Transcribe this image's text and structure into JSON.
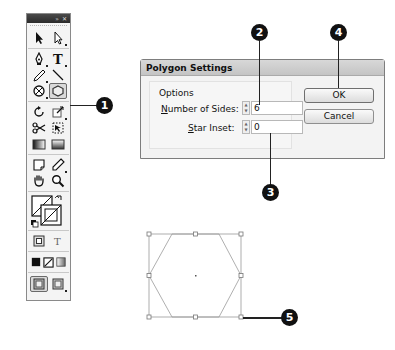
{
  "toolbox": {
    "title_buttons": [
      "»",
      "✕"
    ],
    "tools": [
      [
        "selection-tool",
        "direct-selection-tool"
      ],
      [
        "pen-tool",
        "type-tool"
      ],
      [
        "pencil-tool",
        "line-tool"
      ],
      [
        "ellipse-frame-tool",
        "polygon-tool"
      ],
      [
        "rotate-tool",
        "scale-tool"
      ],
      [
        "scissors-tool",
        "free-transform-tool"
      ],
      [
        "gradient-tool",
        "gradient-feather-tool"
      ],
      [
        "note-tool",
        "eyedropper-tool"
      ],
      [
        "hand-tool",
        "zoom-tool"
      ]
    ],
    "active_tool": "polygon-tool",
    "formatting_buttons": [
      "formatting-affects-container",
      "formatting-affects-text"
    ],
    "formatting_text_glyph": "T",
    "color_buttons": [
      "apply-color",
      "apply-none",
      "apply-gradient"
    ],
    "view_buttons": [
      "normal-view-mode",
      "preview-mode"
    ]
  },
  "dialog": {
    "title": "Polygon Settings",
    "group_label": "Options",
    "fields": [
      {
        "label_prefix": "",
        "label_accel": "N",
        "label_rest": "umber of Sides:",
        "value": "6"
      },
      {
        "label_prefix": "",
        "label_accel": "S",
        "label_rest": "tar Inset:",
        "value": "0"
      }
    ],
    "buttons": {
      "ok": "OK",
      "cancel": "Cancel"
    }
  },
  "callouts": [
    "1",
    "2",
    "3",
    "4",
    "5"
  ],
  "colors": {
    "callout_bg": "#111111",
    "shape_stroke": "#8c8c8c",
    "dialog_bg": "#f3f3f3"
  }
}
